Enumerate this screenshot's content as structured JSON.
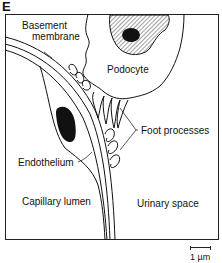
{
  "figure": {
    "panel_letter": "E",
    "labels": {
      "basement_membrane_line1": "Basement",
      "basement_membrane_line2": "membrane",
      "podocyte": "Podocyte",
      "foot_processes": "Foot processes",
      "endothelium": "Endothelium",
      "capillary_lumen": "Capillary lumen",
      "urinary_space": "Urinary space"
    },
    "scale_bar": {
      "label": "1 µm"
    },
    "colors": {
      "ink": "#111111",
      "background": "#ffffff"
    }
  }
}
